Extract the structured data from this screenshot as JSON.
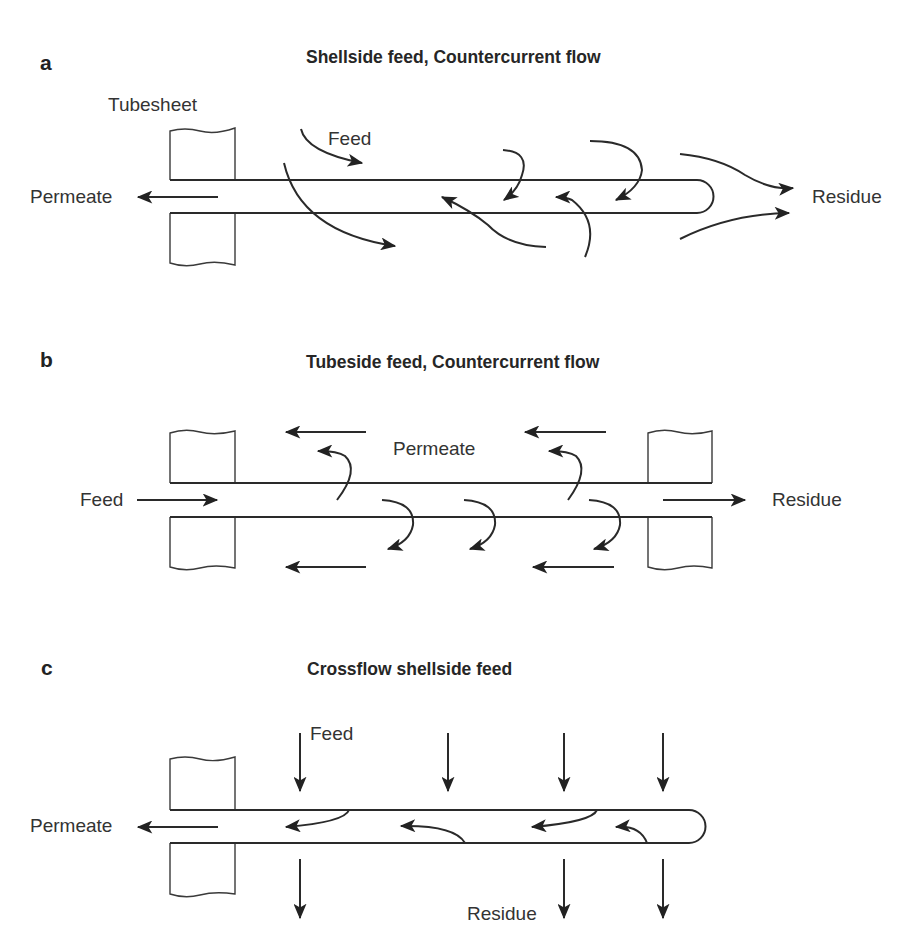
{
  "figure": {
    "top_cut_text": "... ... ... ...",
    "panels": [
      {
        "id": "a",
        "letter": "a",
        "title": "Shellside feed, Countercurrent flow",
        "labels": {
          "tubesheet": "Tubesheet",
          "feed": "Feed",
          "permeate": "Permeate",
          "residue": "Residue"
        }
      },
      {
        "id": "b",
        "letter": "b",
        "title": "Tubeside feed, Countercurrent flow",
        "labels": {
          "feed": "Feed",
          "permeate": "Permeate",
          "residue": "Residue"
        }
      },
      {
        "id": "c",
        "letter": "c",
        "title": "Crossflow shellside feed",
        "labels": {
          "feed": "Feed",
          "permeate": "Permeate",
          "residue": "Residue"
        }
      }
    ],
    "colors": {
      "line": "#2a2a2a",
      "text": "#333333",
      "background": "#ffffff"
    }
  }
}
